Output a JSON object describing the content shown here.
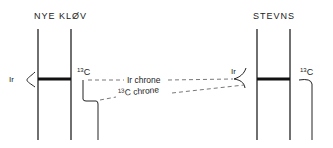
{
  "sections": {
    "left": {
      "title": "NYE KLØV",
      "ir_label": "Ir",
      "c13_label": {
        "superscript": "13",
        "base": "C"
      }
    },
    "right": {
      "title": "STEVNS",
      "ir_label": "Ir",
      "c13_label": {
        "superscript": "13",
        "base": "C"
      }
    }
  },
  "correlation_lines": {
    "ir_chrone": {
      "label": "Ir chrone"
    },
    "c13_chrone": {
      "superscript": "13",
      "label": "C chrone"
    }
  },
  "colors": {
    "ink": "#222222",
    "background": "#ffffff"
  }
}
